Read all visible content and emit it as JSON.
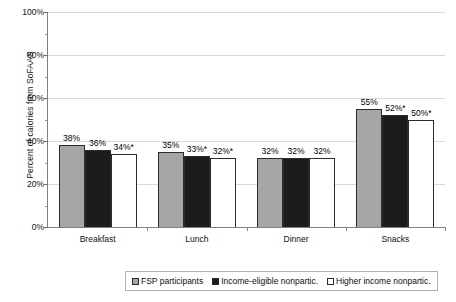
{
  "chart_data": {
    "type": "bar",
    "title": "",
    "xlabel": "",
    "ylabel": "Percent of calories from SoFAAS",
    "ylim": [
      0,
      100
    ],
    "ytick_labels": [
      "0%",
      "20%",
      "40%",
      "60%",
      "80%",
      "100%"
    ],
    "ytick_values": [
      0,
      20,
      40,
      60,
      80,
      100
    ],
    "minor_ytick_values": [
      10,
      30,
      50,
      70,
      90
    ],
    "grid": true,
    "legend_position": "bottom",
    "categories": [
      "Breakfast",
      "Lunch",
      "Dinner",
      "Snacks"
    ],
    "series": [
      {
        "name": "FSP participants",
        "color": "#a6a6a6",
        "values": [
          38,
          35,
          32,
          55
        ],
        "labels": [
          "38%",
          "35%",
          "32%",
          "55%"
        ]
      },
      {
        "name": "Income-eligible nonpartic.",
        "color": "#1c1c1c",
        "values": [
          36,
          33,
          32,
          52
        ],
        "labels": [
          "36%",
          "33%*",
          "32%",
          "52%*"
        ]
      },
      {
        "name": "Higher income nonpartic.",
        "color": "#ffffff",
        "values": [
          34,
          32,
          32,
          50
        ],
        "labels": [
          "34%*",
          "32%*",
          "32%",
          "50%*"
        ]
      }
    ]
  },
  "legend": {
    "items": [
      {
        "label": "FSP participants"
      },
      {
        "label": "Income-eligible nonpartic."
      },
      {
        "label": "Higher income nonpartic."
      }
    ]
  }
}
